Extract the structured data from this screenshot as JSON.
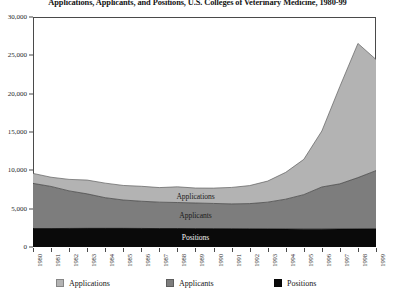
{
  "title": "Applications, Applicants, and Positions, U.S. Colleges of Veterinary Medicine, 1980-99",
  "series_labels": {
    "applications": "Applications",
    "applicants": "Applicants",
    "positions": "Positions"
  },
  "legend": {
    "items": [
      {
        "label": "Applications",
        "color": "#b3b3b3"
      },
      {
        "label": "Applicants",
        "color": "#7d7d7d"
      },
      {
        "label": "Positions",
        "color": "#0a0a0a"
      }
    ]
  },
  "chart_data": {
    "type": "area",
    "stacked": true,
    "title": "Applications, Applicants, and Positions, U.S. Colleges of Veterinary Medicine, 1980-99",
    "xlabel": "",
    "ylabel": "",
    "grid": false,
    "legend_position": "bottom",
    "x": [
      1980,
      1981,
      1982,
      1983,
      1984,
      1985,
      1986,
      1987,
      1988,
      1989,
      1990,
      1991,
      1992,
      1993,
      1994,
      1995,
      1996,
      1997,
      1998,
      1999
    ],
    "categories": [
      "1980",
      "1981",
      "1982",
      "1983",
      "1984",
      "1985",
      "1986",
      "1987",
      "1988",
      "1989",
      "1990",
      "1991",
      "1992",
      "1993",
      "1994",
      "1995",
      "1996",
      "1997",
      "1998",
      "1999"
    ],
    "xtick_labels": [
      "1980",
      "1981",
      "1982",
      "1983",
      "1984",
      "1985",
      "1986",
      "1987",
      "1988",
      "1989",
      "1990",
      "1991",
      "1992",
      "1993",
      "1994",
      "1995",
      "1996",
      "1997",
      "1998",
      "1999"
    ],
    "ytick_labels": [
      "0",
      "5,000",
      "10,000",
      "15,000",
      "20,000",
      "25,000",
      "30,000"
    ],
    "ytick_values": [
      0,
      5000,
      10000,
      15000,
      20000,
      25000,
      30000
    ],
    "ylim": [
      0,
      30000
    ],
    "xlim": [
      1980,
      1999
    ],
    "series": [
      {
        "name": "Positions",
        "color": "#0a0a0a",
        "values": [
          2400,
          2400,
          2420,
          2430,
          2430,
          2430,
          2420,
          2400,
          2400,
          2390,
          2380,
          2370,
          2360,
          2350,
          2340,
          2330,
          2330,
          2340,
          2350,
          2360
        ]
      },
      {
        "name": "Applicants",
        "color": "#7d7d7d",
        "values": [
          5900,
          5500,
          4900,
          4500,
          4000,
          3700,
          3550,
          3450,
          3400,
          3350,
          3300,
          3250,
          3300,
          3500,
          3900,
          4500,
          5500,
          5900,
          6700,
          7600
        ]
      },
      {
        "name": "Applications",
        "color": "#b3b3b3",
        "values": [
          1300,
          1200,
          1500,
          1800,
          1900,
          1900,
          1950,
          1900,
          2050,
          1950,
          2000,
          2150,
          2350,
          2750,
          3500,
          4600,
          7300,
          12700,
          17500,
          14500
        ]
      }
    ],
    "cumulative_top": {
      "positions": [
        2400,
        2400,
        2420,
        2430,
        2430,
        2430,
        2420,
        2400,
        2400,
        2390,
        2380,
        2370,
        2360,
        2350,
        2340,
        2330,
        2330,
        2340,
        2350,
        2360
      ],
      "applicants": [
        8300,
        7900,
        7320,
        6930,
        6430,
        6130,
        5970,
        5850,
        5800,
        5740,
        5680,
        5620,
        5660,
        5850,
        6240,
        6830,
        7830,
        8240,
        9050,
        9960
      ],
      "applications": [
        9600,
        9100,
        8820,
        8730,
        8330,
        8030,
        7920,
        7750,
        7850,
        7690,
        7680,
        7770,
        8010,
        8600,
        9740,
        11430,
        15130,
        20940,
        26550,
        24460
      ]
    }
  }
}
